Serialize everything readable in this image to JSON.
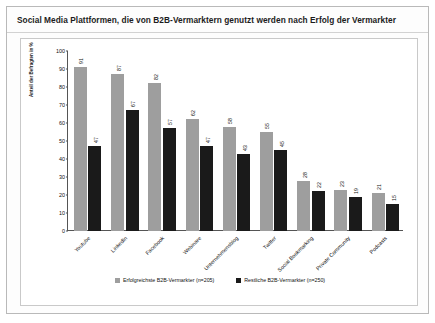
{
  "header": {
    "title": "Social Media Plattformen, die von B2B-Vermarktern genutzt werden nach Erfolg der Vermarkter"
  },
  "chart_data": {
    "type": "bar",
    "title": "",
    "xlabel": "",
    "ylabel": "Anteil der Befragten in %",
    "ylim": [
      0,
      100
    ],
    "yticks": [
      0,
      10,
      20,
      30,
      40,
      50,
      60,
      70,
      80,
      90,
      100
    ],
    "grid": false,
    "legend_position": "bottom",
    "categories": [
      "Youtube",
      "LinkedIn",
      "Facebook",
      "Webinare",
      "Unternehmensblog",
      "Twitter",
      "Social Bookmarking",
      "Private Community",
      "Podcasts"
    ],
    "series": [
      {
        "name": "Erfolgreichste B2B-Vermarkter (n=205)",
        "color": "#9e9e9e",
        "values": [
          91,
          87,
          82,
          62,
          58,
          55,
          28,
          23,
          21
        ]
      },
      {
        "name": "Restliche B2B-Vermarkter (n=250)",
        "color": "#1a1a1a",
        "values": [
          47,
          67,
          57,
          47,
          43,
          45,
          22,
          19,
          15
        ]
      }
    ]
  }
}
